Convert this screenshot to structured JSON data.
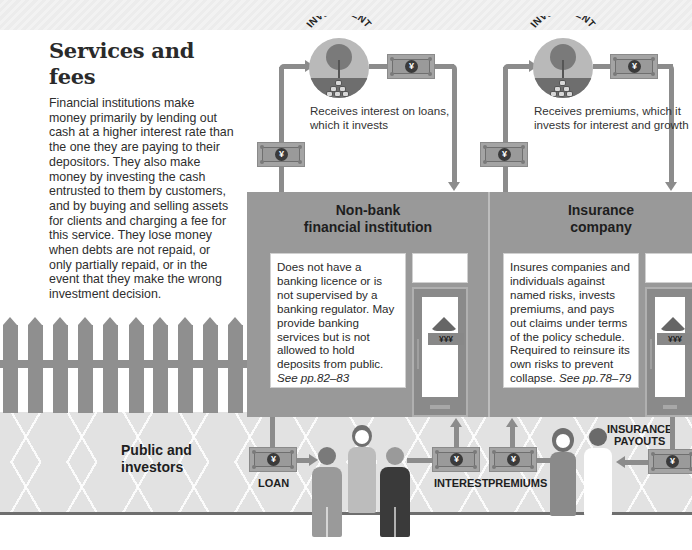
{
  "intro": {
    "title": "Services and fees",
    "body": "Financial institutions make money primarily by lending out cash at a higher interest rate than the one they are paying to their depositors. They also make money by investing the cash entrusted to them by customers, and by buying and selling assets for clients and charging a fee for this service. They lose money when debts are not repaid, or only partially repaid, or in the event that they make the wrong investment decision."
  },
  "colors": {
    "building": "#999999",
    "pipe": "#8c8c8c",
    "street": "#e2e2e2",
    "text": "#222222"
  },
  "investment_badges": [
    {
      "label": "INVESTMENT",
      "caption_line1": "Receives interest on loans,",
      "caption_line2": "which it invests"
    },
    {
      "label": "INVESTMENT",
      "caption_line1": "Receives premiums, which it",
      "caption_line2": "invests for interest and growth"
    }
  ],
  "buildings": [
    {
      "title_line1": "Non-bank",
      "title_line2": "financial institution",
      "description": "Does not have a banking licence or is not supervised by a banking regulator. May provide banking services but is not allowed to hold deposits from public.",
      "see_ref": "See pp.82–83",
      "door_sign": "¥¥¥"
    },
    {
      "title_line1": "Insurance",
      "title_line2": "company",
      "description": "Insures companies and individuals against named risks, invests premiums, and pays out claims under terms of the policy schedule. Required to reinsure its own risks to prevent collapse.",
      "see_ref": "See pp.78–79",
      "door_sign": "¥¥¥"
    }
  ],
  "street": {
    "public_label_line1": "Public and",
    "public_label_line2": "investors"
  },
  "flows": {
    "loan": "LOAN",
    "interest": "INTEREST",
    "premiums": "PREMIUMS",
    "payouts_line1": "INSURANCE",
    "payouts_line2": "PAYOUTS"
  },
  "icons": {
    "currency_symbol": "¥"
  }
}
